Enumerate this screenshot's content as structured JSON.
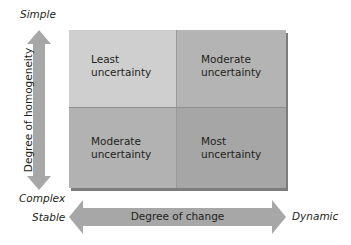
{
  "diagram": {
    "type": "2x2 matrix",
    "vertical_axis": {
      "label": "Degree of homogeneity",
      "top_label": "Simple",
      "bottom_label": "Complex"
    },
    "horizontal_axis": {
      "label": "Degree of change",
      "left_label": "Stable",
      "right_label": "Dynamic"
    },
    "cells": [
      {
        "position": "top-left",
        "line1": "Least",
        "line2": "uncertainty"
      },
      {
        "position": "top-right",
        "line1": "Moderate",
        "line2": "uncertainty"
      },
      {
        "position": "bottom-left",
        "line1": "Moderate",
        "line2": "uncertainty"
      },
      {
        "position": "bottom-right",
        "line1": "Most",
        "line2": "uncertainty"
      }
    ],
    "colors": {
      "arrow": "#a7a7a7",
      "cell_top_left": "#cfcfcf",
      "cell_top_right": "#b4b4b4",
      "cell_bottom_left": "#b2b2b2",
      "cell_bottom_right": "#a6a6a6"
    }
  }
}
